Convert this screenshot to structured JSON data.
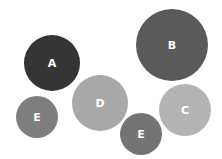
{
  "diagram": {
    "type": "bubbles",
    "bubbles": [
      {
        "label": "A",
        "cx": 52,
        "cy": 63,
        "r": 28,
        "color": "#353535"
      },
      {
        "label": "B",
        "cx": 172,
        "cy": 45,
        "r": 36,
        "color": "#5a5a5a"
      },
      {
        "label": "D",
        "cx": 100,
        "cy": 103,
        "r": 28,
        "color": "#a8a8a8"
      },
      {
        "label": "C",
        "cx": 185,
        "cy": 110,
        "r": 26,
        "color": "#b4b4b4"
      },
      {
        "label": "E",
        "cx": 37,
        "cy": 117,
        "r": 21,
        "color": "#7e7e7e"
      },
      {
        "label": "E",
        "cx": 141,
        "cy": 134,
        "r": 21,
        "color": "#747474"
      }
    ]
  }
}
